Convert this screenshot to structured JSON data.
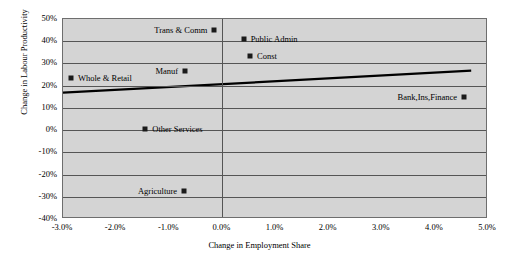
{
  "chart_data": {
    "type": "scatter",
    "title": "",
    "xlabel": "Change in Employment Share",
    "ylabel": "Change in Labour Productivity",
    "xlim": [
      -3.0,
      5.0
    ],
    "ylim": [
      -40,
      50
    ],
    "xticks": [
      "-3.0%",
      "-2.0%",
      "-1.0%",
      "0.0%",
      "1.0%",
      "2.0%",
      "3.0%",
      "4.0%",
      "5.0%"
    ],
    "xtick_values": [
      -3.0,
      -2.0,
      -1.0,
      0.0,
      1.0,
      2.0,
      3.0,
      4.0,
      5.0
    ],
    "yticks": [
      "50%",
      "40%",
      "30%",
      "20%",
      "10%",
      "0%",
      "-10%",
      "-20%",
      "-30%",
      "-40%"
    ],
    "ytick_values": [
      50,
      40,
      30,
      20,
      10,
      0,
      -10,
      -20,
      -30,
      -40
    ],
    "grid": "horizontal gridlines plus vertical axis at 0.0%",
    "legend": "none",
    "plot_background": "#d4d4d4",
    "marker_color": "#1a1a1a",
    "trendline_color": "#000000",
    "points": [
      {
        "label": "Trans & Comm",
        "x": -0.15,
        "y": 45.0,
        "label_side": "left"
      },
      {
        "label": "Public Admin",
        "x": 0.4,
        "y": 41.0,
        "label_side": "right"
      },
      {
        "label": "Const",
        "x": 0.52,
        "y": 33.5,
        "label_side": "right"
      },
      {
        "label": "Manuf",
        "x": -0.7,
        "y": 26.8,
        "label_side": "left"
      },
      {
        "label": "Whole & Retail",
        "x": -2.85,
        "y": 23.5,
        "label_side": "right"
      },
      {
        "label": "Bank,Ins,Finance",
        "x": 4.55,
        "y": 15.0,
        "label_side": "left"
      },
      {
        "label": "Other Services",
        "x": -1.45,
        "y": 0.3,
        "label_side": "right"
      },
      {
        "label": "Agriculture",
        "x": -0.72,
        "y": -27.5,
        "label_side": "left"
      }
    ],
    "trendline": {
      "x_start": -3.0,
      "y_start": 16.5,
      "x_end": 4.72,
      "y_end": 26.5
    }
  }
}
